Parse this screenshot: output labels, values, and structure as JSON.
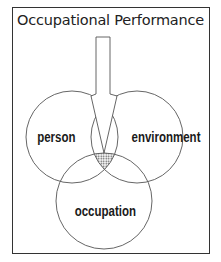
{
  "diagram": {
    "title": "Occupational Performance",
    "circles": [
      {
        "label": "person"
      },
      {
        "label": "environment"
      },
      {
        "label": "occupation"
      }
    ],
    "arrow": {
      "direction": "down",
      "target": "intersection"
    },
    "colors": {
      "line": "#555555",
      "shade": "#999999",
      "text": "#1a1a1a"
    }
  }
}
